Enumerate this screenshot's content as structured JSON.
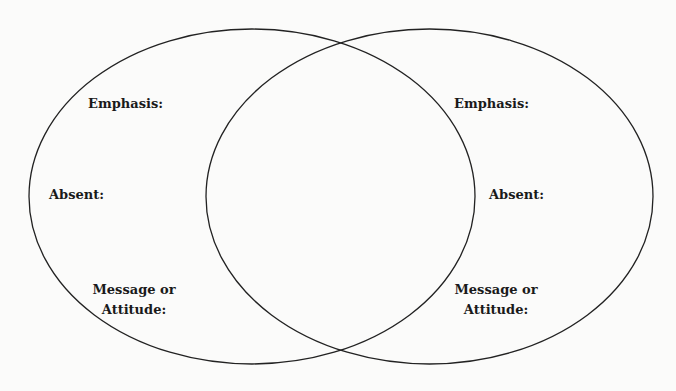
{
  "diagram": {
    "type": "venn",
    "stroke_color": "#222222",
    "background": "#fbfbfa",
    "circles": [
      {
        "id": "left",
        "labels": {
          "emphasis": "Emphasis:",
          "absent": "Absent:",
          "message_line1": "Message or",
          "message_line2": "Attitude:"
        }
      },
      {
        "id": "right",
        "labels": {
          "emphasis": "Emphasis:",
          "absent": "Absent:",
          "message_line1": "Message or",
          "message_line2": "Attitude:"
        }
      }
    ]
  }
}
